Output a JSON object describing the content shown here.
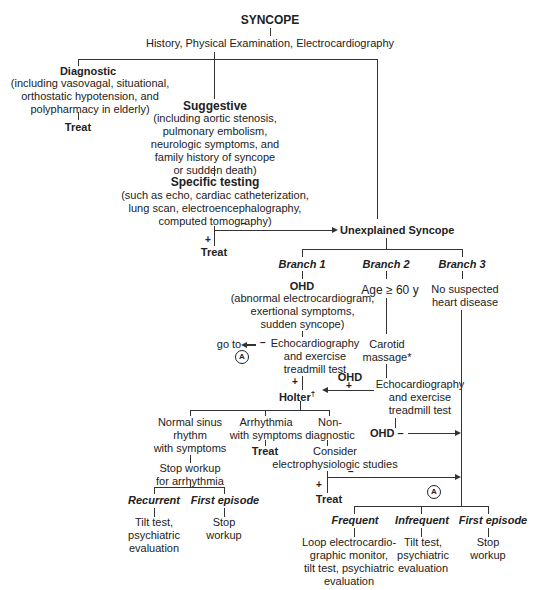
{
  "diagram": {
    "title": "SYNCOPE",
    "initial_eval": "History, Physical Examination, Electrocardiography",
    "diagnostic": {
      "label": "Diagnostic",
      "detail": "(including vasovagal, situational,\northostatic hypotension, and\npolypharmacy in elderly)",
      "outcome": "Treat"
    },
    "suggestive": {
      "label": "Suggestive",
      "detail": "(including aortic stenosis,\npulmonary embolism,\nneurologic symptoms, and\nfamily history of syncope\nor sudden death)"
    },
    "specific_testing": {
      "label": "Specific testing",
      "detail": "(such as echo, cardiac catheterization,\nlung scan, electroencephalography,\ncomputed tomography)",
      "plus_sign": "+",
      "minus_sign": "–",
      "plus_outcome": "Treat"
    },
    "unexplained": "Unexplained Syncope",
    "branches": [
      {
        "label": "Branch 1",
        "condition": "OHD",
        "condition_detail": "(abnormal electrocardiogram,\nexertional symptoms,\nsudden syncope)",
        "test": "Echocardiography\nand exercise\ntreadmill test",
        "negative_goto": "go to",
        "connector": "A",
        "holter": "Holter",
        "holter_mark": "†",
        "holter_outcomes": [
          {
            "label": "Normal sinus\nrhythm\nwith symptoms",
            "next": "Stop workup\nfor arrhythmia"
          },
          {
            "label": "Arrhythmia\nwith symptoms",
            "next": "Treat"
          },
          {
            "label": "Non-\ndiagnostic",
            "next": "Consider\nelectrophysiologic studies"
          }
        ],
        "nsr_subbranches": [
          {
            "label": "Recurrent",
            "action": "Tilt test,\npsychiatric\nevaluation"
          },
          {
            "label": "First episode",
            "action": "Stop\nworkup"
          }
        ],
        "ep_plus_outcome": "Treat"
      },
      {
        "label": "Branch 2",
        "condition": "Age ≥ 60 y",
        "test1": "Carotid\nmassage*",
        "test2": "Echocardiography\nand exercise\ntreadmill test",
        "ohd_positive": "OHD",
        "ohd_negative": "OHD –"
      },
      {
        "label": "Branch 3",
        "condition": "No suspected\nheart disease"
      }
    ],
    "final_connector": "A",
    "final_outcomes": [
      {
        "label": "Frequent",
        "action": "Loop electrocardio-\ngraphic monitor,\ntilt test, psychiatric\nevaluation"
      },
      {
        "label": "Infrequent",
        "action": "Tilt test,\npsychiatric\nevaluation"
      },
      {
        "label": "First episode",
        "action": "Stop\nworkup"
      }
    ],
    "signs": {
      "plus": "+",
      "minus": "–"
    }
  }
}
